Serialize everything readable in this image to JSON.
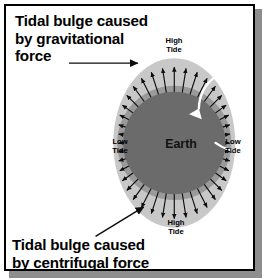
{
  "figure": {
    "captions": {
      "top": "Tidal bulge caused\nby gravitational\nforce",
      "bottom": "Tidal bulge caused\nby centrifugal force"
    },
    "labels": {
      "earth": "Earth",
      "high_tide_top": "High\nTide",
      "high_tide_bottom": "High\nTide",
      "low_tide_left": "Low\nTide",
      "low_tide_right": "Low\nTide"
    },
    "pointer_arrows": [
      {
        "name": "gravitational-pointer-arrow",
        "from": [
          68,
          62
        ],
        "to": [
          143,
          62
        ],
        "direction": "right"
      },
      {
        "name": "centrifugal-pointer-arrow",
        "from": [
          95,
          238
        ],
        "to": [
          146,
          207
        ],
        "direction": "up-right"
      }
    ],
    "rotation_arrow": {
      "name": "earth-rotation-arrow",
      "direction": "counterclockwise",
      "color": "#ffffff"
    },
    "colors": {
      "background": "#ffffff",
      "frame_border": "#000000",
      "frame_shadow": "#8e8e8e",
      "tidal_bulge_light": "#c8c8c8",
      "ocean_ring": "#9e9e9e",
      "earth_body": "#6b6b6b",
      "arrow_black": "#0d0d0d",
      "text": "#000000"
    },
    "geometry": {
      "bulge_ellipse": {
        "cx": 175,
        "cy": 143,
        "rx": 62,
        "ry": 86
      },
      "earth_circle": {
        "cx": 175,
        "cy": 143,
        "r": 52
      },
      "rotation_arc_radius": 42,
      "radial_arrow_count": 40
    },
    "radial_arrows_note": "Black radial arrows point outward from Earth's surface; longest at top and bottom (high tide), shortest at left and right (low tide)."
  }
}
